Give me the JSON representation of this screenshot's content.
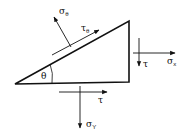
{
  "diagram": {
    "labels": {
      "sigma_theta": {
        "symbol": "σ",
        "sub": "θ"
      },
      "tau_theta": {
        "symbol": "τ",
        "sub": "θ"
      },
      "sigma_x": {
        "symbol": "σ",
        "sub": "x"
      },
      "tau_right": {
        "symbol": "τ",
        "sub": ""
      },
      "tau_bottom": {
        "symbol": "τ",
        "sub": ""
      },
      "sigma_y": {
        "symbol": "σ",
        "sub": "Y"
      },
      "angle": {
        "symbol": "θ"
      }
    },
    "colors": {
      "stroke": "#111111",
      "background": "#ffffff"
    }
  }
}
